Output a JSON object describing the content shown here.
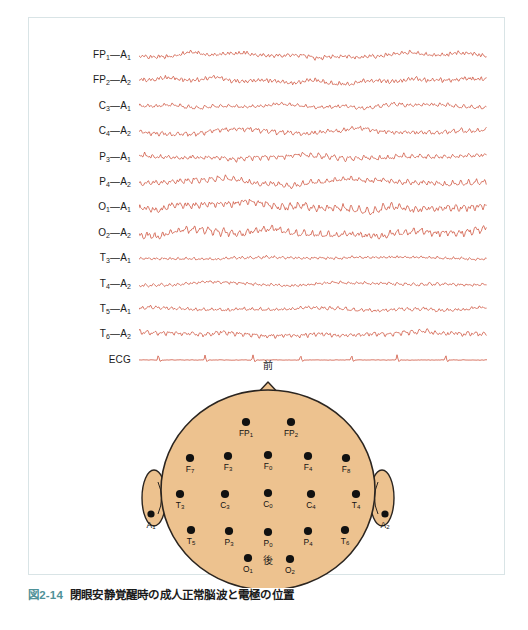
{
  "figure": {
    "caption_number": "図2-14",
    "caption_text": "閉眼安静覚醒時の成人正常脳波と電極の位置",
    "caption_number_color": "#4f9298",
    "frame_border_color": "#d9e4e6"
  },
  "eeg": {
    "trace_color": "#cf5640",
    "channels": [
      {
        "label": "FP₁—A₁",
        "base": "FP",
        "sub1": "1",
        "sub2": "1",
        "amplitude": 3.2,
        "alpha": 0.55,
        "kind": "eeg"
      },
      {
        "label": "FP₂—A₂",
        "base": "FP",
        "sub1": "2",
        "sub2": "2",
        "amplitude": 3.6,
        "alpha": 0.5,
        "kind": "eeg"
      },
      {
        "label": "C₃—A₁",
        "base": "C",
        "sub1": "3",
        "sub2": "1",
        "amplitude": 2.4,
        "alpha": 0.8,
        "kind": "eeg"
      },
      {
        "label": "C₄—A₂",
        "base": "C",
        "sub1": "4",
        "sub2": "2",
        "amplitude": 3.0,
        "alpha": 0.9,
        "kind": "eeg"
      },
      {
        "label": "P₃—A₁",
        "base": "P",
        "sub1": "3",
        "sub2": "1",
        "amplitude": 3.0,
        "alpha": 1.1,
        "kind": "eeg"
      },
      {
        "label": "P₄—A₂",
        "base": "P",
        "sub1": "4",
        "sub2": "2",
        "amplitude": 3.4,
        "alpha": 1.2,
        "kind": "eeg"
      },
      {
        "label": "O₁—A₁",
        "base": "O",
        "sub1": "1",
        "sub2": "1",
        "amplitude": 4.6,
        "alpha": 1.6,
        "kind": "eeg"
      },
      {
        "label": "O₂—A₂",
        "base": "O",
        "sub1": "2",
        "sub2": "2",
        "amplitude": 4.4,
        "alpha": 1.55,
        "kind": "eeg"
      },
      {
        "label": "T₃—A₁",
        "base": "T",
        "sub1": "3",
        "sub2": "1",
        "amplitude": 1.9,
        "alpha": 0.5,
        "kind": "eeg"
      },
      {
        "label": "T₄—A₂",
        "base": "T",
        "sub1": "4",
        "sub2": "2",
        "amplitude": 2.0,
        "alpha": 0.55,
        "kind": "eeg"
      },
      {
        "label": "T₅—A₁",
        "base": "T",
        "sub1": "5",
        "sub2": "1",
        "amplitude": 2.3,
        "alpha": 0.7,
        "kind": "eeg"
      },
      {
        "label": "T₆—A₂",
        "base": "T",
        "sub1": "6",
        "sub2": "2",
        "amplitude": 3.0,
        "alpha": 0.95,
        "kind": "eeg"
      },
      {
        "label": "ECG",
        "base": "ECG",
        "sub1": "",
        "sub2": "",
        "amplitude": 0.35,
        "alpha": 0,
        "kind": "ecg"
      }
    ]
  },
  "head_map": {
    "front_label": "前",
    "back_label": "後",
    "scalp_fill": "#edc28f",
    "scalp_stroke": "#2b2520",
    "electrode_color": "#111111",
    "electrodes": [
      {
        "name": "FP1",
        "label": "FP",
        "sub": "1",
        "x": 118,
        "y": 52
      },
      {
        "name": "FP2",
        "label": "FP",
        "sub": "2",
        "x": 163,
        "y": 52
      },
      {
        "name": "F7",
        "label": "F",
        "sub": "7",
        "x": 62,
        "y": 88
      },
      {
        "name": "F3",
        "label": "F",
        "sub": "3",
        "x": 100,
        "y": 86
      },
      {
        "name": "Fz",
        "label": "F",
        "sub": "0",
        "x": 140,
        "y": 85
      },
      {
        "name": "F4",
        "label": "F",
        "sub": "4",
        "x": 180,
        "y": 86
      },
      {
        "name": "F8",
        "label": "F",
        "sub": "8",
        "x": 218,
        "y": 88
      },
      {
        "name": "T3",
        "label": "T",
        "sub": "3",
        "x": 52,
        "y": 124
      },
      {
        "name": "C3",
        "label": "C",
        "sub": "3",
        "x": 97,
        "y": 124
      },
      {
        "name": "Cz",
        "label": "C",
        "sub": "0",
        "x": 140,
        "y": 123
      },
      {
        "name": "C4",
        "label": "C",
        "sub": "4",
        "x": 183,
        "y": 124
      },
      {
        "name": "T4",
        "label": "T",
        "sub": "4",
        "x": 228,
        "y": 124
      },
      {
        "name": "T5",
        "label": "T",
        "sub": "5",
        "x": 63,
        "y": 160
      },
      {
        "name": "P3",
        "label": "P",
        "sub": "3",
        "x": 101,
        "y": 161
      },
      {
        "name": "Pz",
        "label": "P",
        "sub": "0",
        "x": 140,
        "y": 162
      },
      {
        "name": "P4",
        "label": "P",
        "sub": "4",
        "x": 180,
        "y": 161
      },
      {
        "name": "T6",
        "label": "T",
        "sub": "6",
        "x": 217,
        "y": 160
      },
      {
        "name": "O1",
        "label": "O",
        "sub": "1",
        "x": 120,
        "y": 188
      },
      {
        "name": "O2",
        "label": "O",
        "sub": "2",
        "x": 162,
        "y": 189
      }
    ],
    "ear_electrodes": [
      {
        "name": "A1",
        "label": "A",
        "sub": "1",
        "x": 23,
        "y": 144
      },
      {
        "name": "A2",
        "label": "A",
        "sub": "2",
        "x": 257,
        "y": 144
      }
    ]
  }
}
